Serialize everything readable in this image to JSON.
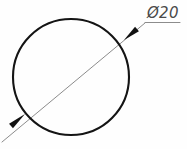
{
  "drawing": {
    "title": "Circle diameter dimension drawing",
    "background_color": "#fefefe",
    "canvas": {
      "width": 187,
      "height": 149
    },
    "dimension_label": {
      "text": "Ø20",
      "symbol": "Ø",
      "value": "20",
      "color": "#4a4a4a",
      "style": "italic"
    },
    "circle": {
      "name": "outer-circle",
      "center_x": 71,
      "center_y": 77,
      "radius": 58,
      "stroke_color": "#141414",
      "stroke_width": 2.1
    },
    "dimension_line": {
      "name": "diameter-dimension-line",
      "x1": 2,
      "y1": 142,
      "x2": 145,
      "y2": 23,
      "stroke_color": "#8c8c8c",
      "stroke_width": 1.0
    },
    "leader_shelf": {
      "name": "leader-shelf-line",
      "x1": 145,
      "y1": 22.5,
      "x2": 180,
      "y2": 22.5,
      "stroke_color": "#8c8c8c",
      "stroke_width": 1.0
    },
    "arrowheads": [
      {
        "name": "arrowhead-upper-right",
        "tip_x": 124,
        "tip_y": 40,
        "tail_x": 137,
        "tail_y": 29,
        "fill_color": "#111111"
      },
      {
        "name": "arrowhead-lower-left",
        "tip_x": 25,
        "tip_y": 114,
        "tail_x": 11,
        "tail_y": 126,
        "fill_color": "#111111"
      }
    ],
    "label_position": {
      "x": 147,
      "y": 18
    }
  }
}
